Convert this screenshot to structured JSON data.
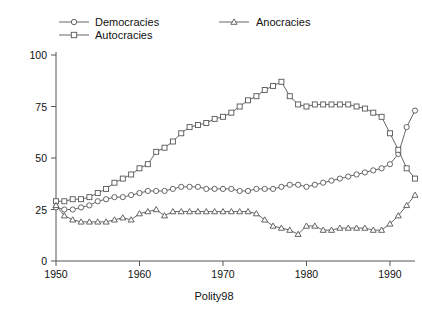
{
  "chart_data": {
    "type": "line",
    "title": "",
    "xlabel": "Polity98",
    "ylabel": "",
    "xlim": [
      1950,
      1993
    ],
    "ylim": [
      0,
      100
    ],
    "xticks": [
      1950,
      1960,
      1970,
      1980,
      1990
    ],
    "yticks": [
      0,
      25,
      50,
      75,
      100
    ],
    "grid": false,
    "legend_position": "top",
    "x": [
      1950,
      1951,
      1952,
      1953,
      1954,
      1955,
      1956,
      1957,
      1958,
      1959,
      1960,
      1961,
      1962,
      1963,
      1964,
      1965,
      1966,
      1967,
      1968,
      1969,
      1970,
      1971,
      1972,
      1973,
      1974,
      1975,
      1976,
      1977,
      1978,
      1979,
      1980,
      1981,
      1982,
      1983,
      1984,
      1985,
      1986,
      1987,
      1988,
      1989,
      1990,
      1991,
      1992,
      1993
    ],
    "series": [
      {
        "name": "Democracies",
        "marker": "circle",
        "values": [
          26,
          25,
          25,
          26,
          27,
          29,
          30,
          31,
          31,
          32,
          33,
          34,
          34,
          34,
          35,
          36,
          36,
          36,
          35,
          35,
          35,
          35,
          34,
          34,
          35,
          35,
          35,
          36,
          37,
          37,
          36,
          37,
          38,
          39,
          40,
          41,
          42,
          43,
          44,
          45,
          47,
          52,
          65,
          73
        ]
      },
      {
        "name": "Autocracies",
        "marker": "square",
        "values": [
          29,
          29,
          30,
          30,
          31,
          33,
          35,
          38,
          40,
          42,
          45,
          47,
          53,
          55,
          58,
          62,
          65,
          66,
          67,
          69,
          70,
          72,
          75,
          78,
          80,
          83,
          85,
          87,
          80,
          76,
          75,
          76,
          76,
          76,
          76,
          76,
          75,
          74,
          72,
          70,
          62,
          54,
          45,
          40
        ]
      },
      {
        "name": "Anocracies",
        "marker": "triangle",
        "values": [
          27,
          22,
          20,
          19,
          19,
          19,
          19,
          20,
          21,
          20,
          23,
          24,
          25,
          22,
          24,
          24,
          24,
          24,
          24,
          24,
          24,
          24,
          24,
          24,
          23,
          20,
          17,
          16,
          15,
          13,
          17,
          17,
          15,
          15,
          16,
          16,
          16,
          16,
          15,
          15,
          18,
          22,
          27,
          32
        ]
      }
    ]
  },
  "legend": {
    "items": [
      {
        "label": "Democracies",
        "marker": "circle"
      },
      {
        "label": "Autocracies",
        "marker": "square"
      },
      {
        "label": "Anocracies",
        "marker": "triangle"
      }
    ]
  },
  "axes": {
    "x_tick_labels": [
      "1950",
      "1960",
      "1970",
      "1980",
      "1990"
    ],
    "y_tick_labels": [
      "0",
      "25",
      "50",
      "75",
      "100"
    ],
    "x_axis_title": "Polity98"
  },
  "colors": {
    "line": "#555555",
    "marker_fill": "#ffffff",
    "text": "#111111",
    "background": "#ffffff"
  }
}
